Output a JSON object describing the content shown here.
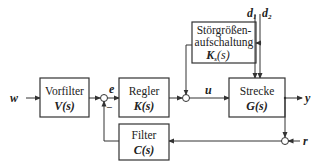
{
  "diagram": {
    "type": "control-loop-block-diagram",
    "blocks": {
      "vorfilter": {
        "label": "Vorfilter",
        "tf": "V(s)"
      },
      "regler": {
        "label": "Regler",
        "tf": "K(s)"
      },
      "strecke": {
        "label": "Strecke",
        "tf": "G(s)"
      },
      "stoer": {
        "label_line1": "Störgrößen-",
        "label_line2": "aufschaltung",
        "tf_main": "K",
        "tf_sub": "s",
        "tf_arg": "(s)"
      },
      "filter": {
        "label": "Filter",
        "tf": "C(s)"
      }
    },
    "signals": {
      "w": "w",
      "e": "e",
      "u": "u",
      "y": "y",
      "r": "r",
      "d1": "d",
      "d1_sub": "1",
      "d2": "d",
      "d2_sub": "2"
    },
    "junctions": {
      "error_sum_minus": "−"
    }
  }
}
